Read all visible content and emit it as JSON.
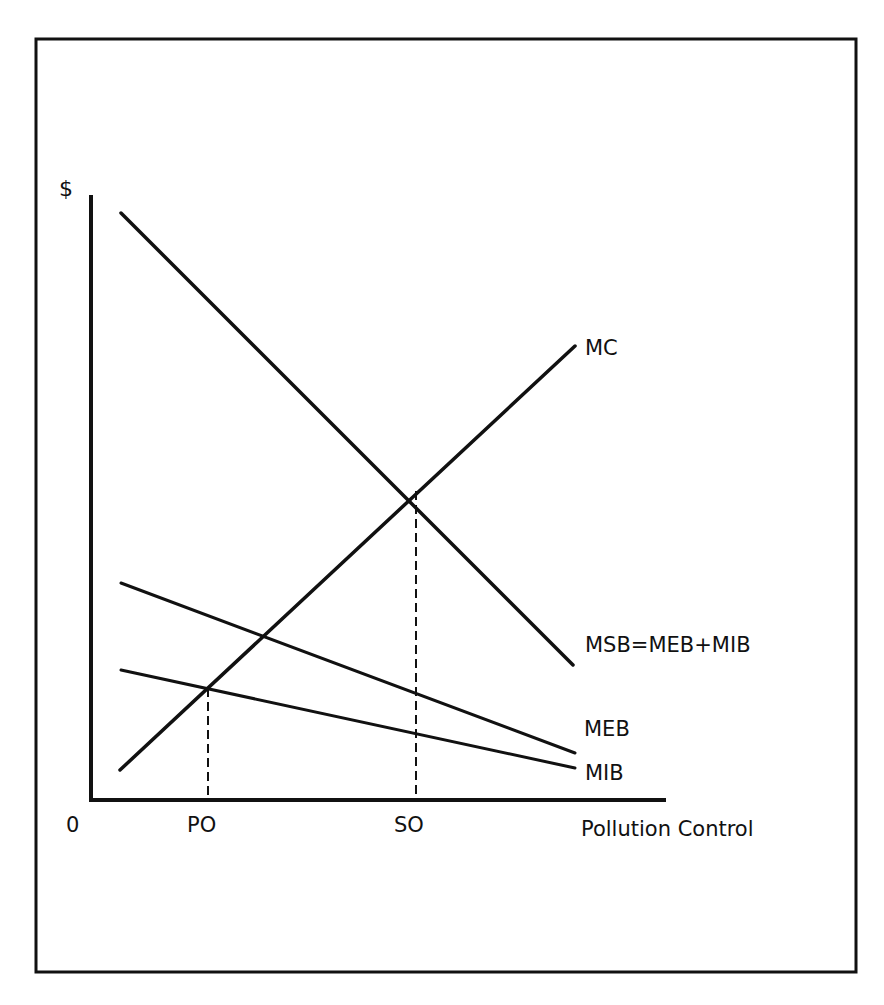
{
  "axes": {
    "y_label": "$",
    "x_label": "Pollution Control",
    "origin_label": "0"
  },
  "x_ticks": [
    {
      "label": "PO",
      "meaning": "private optimum"
    },
    {
      "label": "SO",
      "meaning": "social optimum"
    }
  ],
  "curves": {
    "mc": {
      "label": "MC"
    },
    "msb": {
      "label": "MSB=MEB+MIB"
    },
    "meb": {
      "label": "MEB"
    },
    "mib": {
      "label": "MIB"
    }
  },
  "colors": {
    "ink": "#111111",
    "background": "#ffffff"
  }
}
